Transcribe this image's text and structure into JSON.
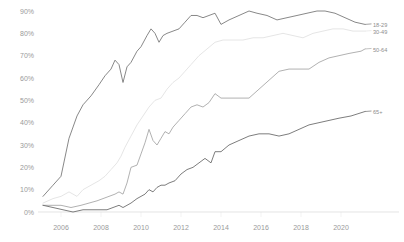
{
  "chart_data": {
    "type": "line",
    "title": "",
    "xlabel": "",
    "ylabel": "",
    "ylim": [
      0,
      90
    ],
    "xlim": [
      2005,
      2021.5
    ],
    "grid": false,
    "legend_position": "right-end-labels",
    "y_ticks": [
      "0%",
      "10%",
      "20%",
      "30%",
      "40%",
      "50%",
      "60%",
      "70%",
      "80%",
      "90%"
    ],
    "y_tick_values": [
      0,
      10,
      20,
      30,
      40,
      50,
      60,
      70,
      80,
      90
    ],
    "x_ticks": [
      "2006",
      "2008",
      "2010",
      "2012",
      "2014",
      "2016",
      "2018",
      "2020"
    ],
    "x_tick_values": [
      2006,
      2008,
      2010,
      2012,
      2014,
      2016,
      2018,
      2020
    ],
    "series": [
      {
        "name": "18-29",
        "label": "18-29",
        "color": "#7a7a7a",
        "end_value": 84,
        "x": [
          2005.1,
          2005.6,
          2006.0,
          2006.4,
          2006.8,
          2007.1,
          2007.5,
          2007.9,
          2008.2,
          2008.5,
          2008.7,
          2008.9,
          2009.1,
          2009.3,
          2009.5,
          2009.8,
          2010.0,
          2010.3,
          2010.5,
          2010.7,
          2010.9,
          2011.1,
          2011.3,
          2011.6,
          2011.9,
          2012.2,
          2012.5,
          2012.8,
          2013.1,
          2013.4,
          2013.7,
          2014.0,
          2014.4,
          2014.9,
          2015.4,
          2015.8,
          2016.3,
          2016.8,
          2017.3,
          2017.8,
          2018.3,
          2018.8,
          2019.2,
          2019.7,
          2020.2,
          2020.7,
          2021.2
        ],
        "y": [
          7,
          12,
          16,
          33,
          43,
          48,
          52,
          57,
          61,
          64,
          68,
          66,
          58,
          65,
          67,
          72,
          74,
          79,
          82,
          80,
          76,
          79,
          80,
          81,
          82,
          85,
          88,
          88,
          87,
          88,
          89,
          84,
          86,
          88,
          90,
          89,
          88,
          86,
          87,
          88,
          89,
          90,
          90,
          89,
          87,
          85,
          84
        ]
      },
      {
        "name": "30-49",
        "label": "30-49",
        "color": "#e2e2e2",
        "end_value": 81,
        "x": [
          2005.1,
          2005.6,
          2006.0,
          2006.4,
          2006.8,
          2007.1,
          2007.5,
          2007.9,
          2008.2,
          2008.5,
          2008.8,
          2009.0,
          2009.2,
          2009.5,
          2009.8,
          2010.1,
          2010.4,
          2010.7,
          2011.0,
          2011.3,
          2011.6,
          2011.9,
          2012.2,
          2012.5,
          2012.9,
          2013.3,
          2013.7,
          2014.1,
          2014.6,
          2015.1,
          2015.6,
          2016.1,
          2016.6,
          2017.1,
          2017.6,
          2018.1,
          2018.6,
          2019.1,
          2019.6,
          2020.1,
          2020.6,
          2021.2
        ],
        "y": [
          4,
          6,
          7,
          9,
          7,
          10,
          12,
          14,
          16,
          19,
          22,
          25,
          29,
          34,
          39,
          43,
          47,
          50,
          51,
          55,
          58,
          60,
          63,
          66,
          70,
          73,
          76,
          77,
          77,
          77,
          78,
          78,
          79,
          80,
          79,
          78,
          80,
          81,
          82,
          82,
          81,
          81
        ]
      },
      {
        "name": "50-64",
        "label": "50-64",
        "color": "#a8a8a8",
        "end_value": 73,
        "x": [
          2005.1,
          2005.6,
          2006.0,
          2006.5,
          2007.0,
          2007.4,
          2007.8,
          2008.1,
          2008.4,
          2008.7,
          2008.9,
          2009.1,
          2009.3,
          2009.5,
          2009.8,
          2010.0,
          2010.2,
          2010.4,
          2010.6,
          2010.8,
          2011.0,
          2011.2,
          2011.4,
          2011.6,
          2011.9,
          2012.2,
          2012.5,
          2012.8,
          2013.1,
          2013.4,
          2013.7,
          2014.0,
          2014.4,
          2014.9,
          2015.4,
          2015.9,
          2016.4,
          2016.9,
          2017.4,
          2017.9,
          2018.4,
          2018.9,
          2019.4,
          2019.9,
          2020.4,
          2021.0,
          2021.2
        ],
        "y": [
          3,
          3,
          3,
          2,
          3,
          4,
          5,
          6,
          7,
          8,
          9,
          8,
          13,
          20,
          21,
          26,
          31,
          37,
          32,
          30,
          33,
          36,
          35,
          38,
          41,
          44,
          47,
          48,
          47,
          49,
          53,
          51,
          51,
          51,
          51,
          55,
          59,
          63,
          64,
          64,
          64,
          67,
          69,
          70,
          71,
          72,
          73
        ]
      },
      {
        "name": "65+",
        "label": "65+",
        "color": "#6e6e6e",
        "end_value": 45,
        "x": [
          2005.1,
          2005.6,
          2006.1,
          2006.6,
          2007.1,
          2007.6,
          2008.0,
          2008.3,
          2008.6,
          2008.9,
          2009.1,
          2009.3,
          2009.5,
          2009.8,
          2010.0,
          2010.2,
          2010.4,
          2010.6,
          2010.8,
          2011.0,
          2011.2,
          2011.4,
          2011.7,
          2012.0,
          2012.3,
          2012.6,
          2012.9,
          2013.2,
          2013.5,
          2013.7,
          2014.0,
          2014.4,
          2014.9,
          2015.4,
          2015.9,
          2016.4,
          2016.9,
          2017.4,
          2017.9,
          2018.4,
          2018.9,
          2019.4,
          2019.9,
          2020.5,
          2021.2
        ],
        "y": [
          3,
          2,
          1,
          0,
          1,
          1,
          1,
          1,
          2,
          3,
          2,
          3,
          4,
          6,
          7,
          8,
          10,
          9,
          11,
          12,
          12,
          13,
          14,
          17,
          19,
          20,
          22,
          24,
          22,
          27,
          27,
          30,
          32,
          34,
          35,
          35,
          34,
          35,
          37,
          39,
          40,
          41,
          42,
          43,
          45
        ]
      }
    ]
  }
}
